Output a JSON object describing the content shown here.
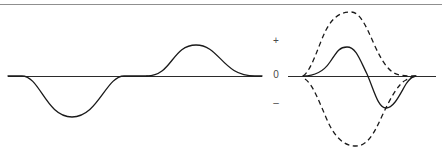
{
  "figure": {
    "title": "",
    "background_color": "#ffffff",
    "top_rule": {
      "name": "top-divider-rule",
      "color": "#8f8f8f",
      "x1": 0,
      "x2": 442,
      "y": 4,
      "width": 1
    },
    "axis_labels": {
      "positive": "+",
      "zero": "0",
      "negative": "–"
    },
    "stroke_colors": {
      "curve": "#1a1a1a",
      "baseline": "#2b2b2b",
      "label": "#4a4a4a"
    }
  },
  "chart_data": {
    "type": "line",
    "title": "",
    "subtitle": "",
    "xlabel": "",
    "ylabel": "",
    "grid": false,
    "legend": null,
    "xlim": [
      0,
      442
    ],
    "ylim": [
      154,
      0
    ],
    "baselines": [
      {
        "name": "left-baseline",
        "x1": 8,
        "x2": 262,
        "y": 76
      },
      {
        "name": "right-baseline",
        "x1": 288,
        "x2": 436,
        "y": 76
      }
    ],
    "tick_labels": [
      "+",
      "0",
      "–"
    ],
    "tick_positions_y": [
      41,
      76,
      103
    ],
    "series": [
      {
        "name": "left-negative-lobe",
        "style": "solid",
        "panel": "left",
        "path": "M 8 76 L 22 76 C 40 76 46 117 72 117 C 98 117 106 76 124 76 L 147 76",
        "extent_x": [
          8,
          147
        ],
        "peak": {
          "x": 72,
          "y": 117,
          "sign": "negative"
        }
      },
      {
        "name": "left-positive-lobe",
        "style": "solid",
        "panel": "left",
        "path": "M 147 76 C 172 76 172 45 196 45 C 220 45 222 76 255 76 L 262 76",
        "extent_x": [
          147,
          262
        ],
        "peak": {
          "x": 196,
          "y": 45,
          "sign": "positive"
        }
      },
      {
        "name": "right-solid-derivative",
        "style": "solid",
        "panel": "right",
        "path": "M 303 76 C 312 76 322 74 330 62 C 338 50 340 47 347 47 C 356 47 360 60 367 74 C 374 90 378 108 386 108 C 394 108 400 94 406 84 C 410 78 413 76 416 76",
        "extent_x": [
          303,
          416
        ],
        "peak": {
          "x": 347,
          "y": 47,
          "sign": "positive"
        },
        "trough": {
          "x": 386,
          "y": 108,
          "sign": "negative"
        }
      },
      {
        "name": "right-dashed-upper-envelope",
        "style": "dashed",
        "panel": "right",
        "path": "M 303 76 C 312 70 318 46 326 30 C 334 15 342 12 351 12 C 360 12 366 26 374 44 C 382 62 390 74 400 75 C 406 76 412 76 416 76",
        "extent_x": [
          303,
          416
        ],
        "peak": {
          "x": 351,
          "y": 12,
          "sign": "positive"
        }
      },
      {
        "name": "right-dashed-lower-envelope",
        "style": "dashed",
        "panel": "right",
        "path": "M 305 79 C 313 84 320 104 328 122 C 336 139 345 146 356 146 C 367 146 374 134 382 116 C 390 99 398 84 406 80 C 410 78 413 77 416 76",
        "extent_x": [
          305,
          416
        ],
        "trough": {
          "x": 356,
          "y": 146,
          "sign": "negative"
        }
      }
    ]
  }
}
